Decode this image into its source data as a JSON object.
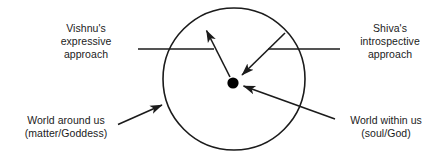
{
  "diagram": {
    "colors": {
      "stroke": "#1b1b1b",
      "text": "#1b1b1b",
      "background": "#ffffff",
      "dot_fill": "#000000"
    },
    "circle": {
      "cx": 234,
      "cy": 79,
      "r": 71,
      "stroke_width": 1.6
    },
    "center_dot": {
      "cx": 233,
      "cy": 83,
      "r": 5.6
    },
    "labels": {
      "vishnu": {
        "name": "Vishnu's expressive approach",
        "lines": [
          "Vishnu's",
          "expressive",
          "approach"
        ]
      },
      "shiva": {
        "name": "Shiva's introspective approach",
        "lines": [
          "Shiva's",
          "introspective",
          "approach"
        ]
      },
      "world_around": {
        "name": "World around us (matter/Goddess)",
        "lines": [
          "World around us",
          "(matter/Goddess)"
        ]
      },
      "world_within": {
        "name": "World within us (soul/God)",
        "lines": [
          "World within us",
          "(soul/God)"
        ]
      }
    },
    "connectors": [
      {
        "name": "vishnu-leader-line",
        "kind": "leader",
        "from": [
          138,
          49
        ],
        "to": [
          214,
          49
        ]
      },
      {
        "name": "shiva-leader-line",
        "kind": "leader",
        "from": [
          268,
          49
        ],
        "to": [
          340,
          49
        ]
      },
      {
        "name": "vishnu-expressive-arrow",
        "kind": "arrow",
        "from": [
          230,
          78
        ],
        "to": [
          205,
          28
        ],
        "direction": "outward-from-center"
      },
      {
        "name": "shiva-introspective-arrow",
        "kind": "arrow",
        "from": [
          285,
          33
        ],
        "to": [
          240,
          77
        ],
        "direction": "inward-to-center"
      },
      {
        "name": "world-around-arrow",
        "kind": "arrow",
        "from": [
          119,
          124
        ],
        "to": [
          163,
          104
        ],
        "direction": "inward-to-circle-edge"
      },
      {
        "name": "world-within-arrow",
        "kind": "arrow",
        "from": [
          334,
          119
        ],
        "to": [
          241,
          86
        ],
        "direction": "inward-to-center"
      }
    ]
  }
}
